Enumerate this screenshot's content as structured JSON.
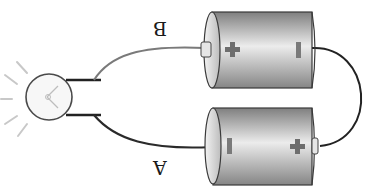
{
  "diagram": {
    "labels": {
      "wire_top": "B",
      "wire_bottom": "A"
    },
    "batteries": [
      {
        "id": "battery-top",
        "plus_symbol": "+",
        "minus_symbol": "−"
      },
      {
        "id": "battery-bottom",
        "plus_symbol": "+",
        "minus_symbol": "−"
      }
    ],
    "bulb": {
      "state": "lit"
    },
    "colors": {
      "wire_top": "#777777",
      "wire_bottom": "#2a2a2a",
      "wire_link": "#222222",
      "battery_light": "#eeeeee",
      "battery_dark": "#8a8a8a",
      "symbol": "#6e6e6e"
    }
  }
}
